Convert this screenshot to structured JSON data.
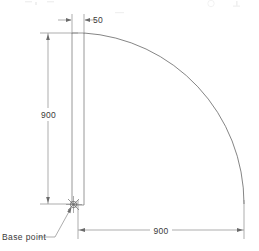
{
  "drawing": {
    "type": "cad-elevation-door-swing",
    "canvas": {
      "width": 259,
      "height": 251,
      "background": "#ffffff"
    },
    "line_color": "#7d7d7d",
    "text_color": "#3a3a3a",
    "dimensions": [
      {
        "id": "panel-thickness",
        "value": "50",
        "orientation": "horizontal",
        "placement": "top",
        "arrow_style": "outside-inward"
      },
      {
        "id": "panel-height",
        "value": "900",
        "orientation": "vertical",
        "placement": "left",
        "arrow_style": "inside"
      },
      {
        "id": "swing-radius",
        "value": "900",
        "orientation": "horizontal",
        "placement": "bottom",
        "arrow_style": "inside"
      }
    ],
    "annotations": [
      {
        "id": "base-point",
        "label": "Base point",
        "marker": "x-cross-with-circle"
      }
    ],
    "geometry": {
      "panel_left_x": 72,
      "panel_right_x": 84,
      "panel_top_y": 33,
      "panel_bottom_y": 204,
      "arc_center_x": 73,
      "arc_center_y": 204,
      "arc_radius": 171
    }
  }
}
